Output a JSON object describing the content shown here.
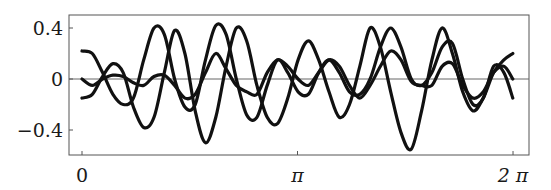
{
  "chart_data": {
    "type": "line",
    "title": "",
    "xlabel": "",
    "ylabel": "",
    "xlim": [
      -0.19,
      6.51
    ],
    "ylim": [
      -0.6,
      0.5
    ],
    "grid": false,
    "legend": null,
    "zero_line": true,
    "x_ticks": [
      {
        "value": 0,
        "label": "0"
      },
      {
        "value": 3.14159,
        "label": "π"
      },
      {
        "value": 6.28318,
        "label": "2 π"
      }
    ],
    "y_ticks": [
      {
        "value": 0.4,
        "label": "0.4"
      },
      {
        "value": 0,
        "label": "0"
      },
      {
        "value": -0.4,
        "label": "−0.4"
      }
    ],
    "series": [
      {
        "name": "curve-1",
        "color": "#111111",
        "x": [
          0.0,
          0.15,
          0.3,
          0.45,
          0.6,
          0.75,
          0.9,
          1.05,
          1.2,
          1.35,
          1.5,
          1.65,
          1.8,
          1.95,
          2.1,
          2.25,
          2.4,
          2.55,
          2.7,
          2.85,
          3.0,
          3.15,
          3.3,
          3.45,
          3.6,
          3.75,
          3.9,
          4.05,
          4.2,
          4.35,
          4.5,
          4.65,
          4.8,
          4.95,
          5.1,
          5.25,
          5.4,
          5.55,
          5.7,
          5.85,
          6.0,
          6.15,
          6.28
        ],
        "y": [
          -0.15,
          -0.12,
          0.02,
          0.12,
          0.05,
          -0.22,
          -0.38,
          -0.3,
          0.05,
          0.38,
          0.2,
          -0.25,
          -0.5,
          -0.3,
          0.1,
          0.4,
          0.3,
          -0.05,
          -0.3,
          -0.35,
          -0.15,
          0.15,
          0.3,
          0.15,
          -0.1,
          -0.3,
          -0.2,
          0.1,
          0.4,
          0.25,
          -0.1,
          -0.42,
          -0.55,
          -0.25,
          0.15,
          0.4,
          0.2,
          -0.1,
          -0.25,
          -0.15,
          0.05,
          0.15,
          0.2
        ]
      },
      {
        "name": "curve-2",
        "color": "#111111",
        "x": [
          0.0,
          0.15,
          0.3,
          0.45,
          0.6,
          0.75,
          0.9,
          1.05,
          1.2,
          1.35,
          1.5,
          1.65,
          1.8,
          1.95,
          2.1,
          2.25,
          2.4,
          2.55,
          2.7,
          2.85,
          3.0,
          3.15,
          3.3,
          3.45,
          3.6,
          3.75,
          3.9,
          4.05,
          4.2,
          4.35,
          4.5,
          4.65,
          4.8,
          4.95,
          5.1,
          5.25,
          5.4,
          5.55,
          5.7,
          5.85,
          6.0,
          6.15,
          6.28
        ],
        "y": [
          0.22,
          0.2,
          0.05,
          -0.12,
          -0.2,
          -0.15,
          0.15,
          0.4,
          0.35,
          0.0,
          -0.22,
          -0.2,
          0.15,
          0.42,
          0.35,
          0.0,
          -0.28,
          -0.3,
          -0.05,
          0.15,
          0.05,
          -0.1,
          -0.12,
          0.05,
          0.15,
          0.05,
          -0.1,
          -0.12,
          0.0,
          0.25,
          0.4,
          0.25,
          0.0,
          -0.05,
          0.05,
          0.25,
          0.28,
          0.0,
          -0.2,
          -0.15,
          0.1,
          0.05,
          -0.15
        ]
      },
      {
        "name": "curve-3",
        "color": "#111111",
        "x": [
          0.0,
          0.15,
          0.3,
          0.45,
          0.6,
          0.75,
          0.9,
          1.05,
          1.2,
          1.35,
          1.5,
          1.65,
          1.8,
          1.95,
          2.1,
          2.25,
          2.4,
          2.55,
          2.7,
          2.85,
          3.0,
          3.15,
          3.3,
          3.45,
          3.6,
          3.75,
          3.9,
          4.05,
          4.2,
          4.35,
          4.5,
          4.65,
          4.8,
          4.95,
          5.1,
          5.25,
          5.4,
          5.55,
          5.7,
          5.85,
          6.0,
          6.15,
          6.28
        ],
        "y": [
          0.0,
          -0.05,
          0.0,
          0.03,
          0.02,
          -0.03,
          -0.05,
          0.02,
          0.03,
          -0.05,
          -0.15,
          -0.12,
          0.05,
          0.2,
          0.08,
          -0.05,
          -0.1,
          -0.12,
          0.05,
          0.15,
          0.1,
          0.0,
          -0.05,
          0.05,
          0.15,
          0.1,
          -0.05,
          -0.15,
          -0.05,
          0.1,
          0.22,
          0.15,
          -0.02,
          -0.05,
          -0.05,
          0.1,
          0.12,
          -0.05,
          -0.15,
          -0.1,
          0.05,
          0.1,
          0.0
        ]
      }
    ]
  },
  "layout": {
    "frame": {
      "left": 69,
      "top": 15,
      "right": 529,
      "bottom": 155
    },
    "x_origin_px": 82,
    "x_px_per_unit": 68.6,
    "y_zero_px": 79,
    "y_px_per_unit": 127.5
  }
}
